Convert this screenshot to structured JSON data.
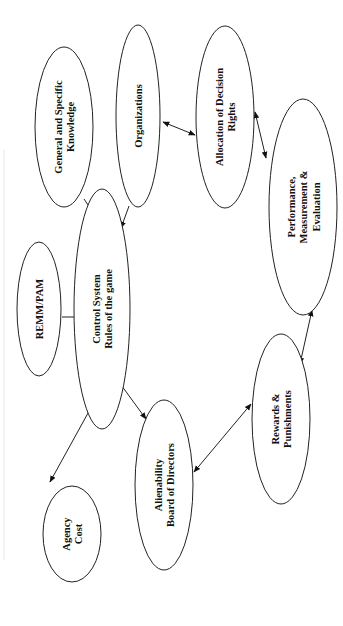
{
  "diagram": {
    "orientation": "rotated 90 degrees counter-clockwise",
    "nodes": [
      {
        "id": "knowledge",
        "lines": [
          "General and Specific",
          "Knowledge"
        ]
      },
      {
        "id": "organizations",
        "lines": [
          "Organizations"
        ]
      },
      {
        "id": "allocation",
        "lines": [
          "Allocation of Decision",
          "Rights"
        ]
      },
      {
        "id": "performance",
        "lines": [
          "Performance,",
          "Measurement &",
          "Evaluation"
        ]
      },
      {
        "id": "remm",
        "lines": [
          "REMM/PAM"
        ]
      },
      {
        "id": "control",
        "lines": [
          "Control System",
          "Rules of the game"
        ]
      },
      {
        "id": "agency",
        "lines": [
          "Agency",
          "Cost"
        ]
      },
      {
        "id": "alienability",
        "lines": [
          "Alienability",
          "Board of Directors"
        ]
      },
      {
        "id": "rewards",
        "lines": [
          "Rewards &",
          "Punishments"
        ]
      }
    ],
    "edges": [
      {
        "from": "knowledge",
        "to": "control",
        "type": "arrow"
      },
      {
        "from": "organizations",
        "to": "control",
        "type": "arrow"
      },
      {
        "from": "organizations",
        "to": "allocation",
        "type": "bidirectional"
      },
      {
        "from": "allocation",
        "to": "performance",
        "type": "bidirectional"
      },
      {
        "from": "performance",
        "to": "rewards",
        "type": "bidirectional"
      },
      {
        "from": "rewards",
        "to": "alienability",
        "type": "bidirectional"
      },
      {
        "from": "alienability",
        "to": "control",
        "type": "bidirectional"
      },
      {
        "from": "agency",
        "to": "control",
        "type": "bidirectional"
      },
      {
        "from": "remm",
        "to": "control",
        "type": "line"
      }
    ]
  }
}
